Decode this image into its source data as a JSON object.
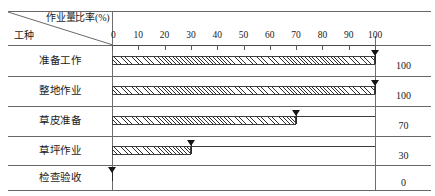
{
  "header": {
    "ratio_label": "作业量比率(%)",
    "trade_label": "工种"
  },
  "chart_data": {
    "type": "bar",
    "title": "",
    "subtitle": "",
    "xlabel": "作业量比率(%)",
    "ylabel": "工种",
    "xlim": [
      0,
      100
    ],
    "grid": false,
    "legend": "none",
    "orientation": "horizontal",
    "tick_labels": [
      "0",
      "10",
      "20",
      "30",
      "40",
      "50",
      "60",
      "70",
      "80",
      "90",
      "100"
    ],
    "tick_values": [
      0,
      10,
      20,
      30,
      40,
      50,
      60,
      70,
      80,
      90,
      100
    ],
    "categories": [
      "准备工作",
      "整地作业",
      "草皮准备",
      "草坪作业",
      "检查验收"
    ],
    "values": [
      100,
      100,
      70,
      30,
      0
    ],
    "value_labels": [
      "100",
      "100",
      "70",
      "30",
      "0"
    ],
    "rows": [
      {
        "label": "准备工作",
        "value": 100,
        "value_label": "100",
        "marker_at": 100
      },
      {
        "label": "整地作业",
        "value": 100,
        "value_label": "100",
        "marker_at": 100
      },
      {
        "label": "草皮准备",
        "value": 70,
        "value_label": "70",
        "marker_at": 70
      },
      {
        "label": "草坪作业",
        "value": 30,
        "value_label": "30",
        "marker_at": 30
      },
      {
        "label": "检查验收",
        "value": 0,
        "value_label": "0",
        "marker_at": 0
      }
    ],
    "colors": {
      "bar_hatch": "#2f2f2f",
      "bar_fill": "#ffffff",
      "bar_border": "#3d3d3d",
      "marker": "#151515",
      "rule": "#676767",
      "axis": "#4a4a4a",
      "text": "#1a1a1a"
    }
  }
}
